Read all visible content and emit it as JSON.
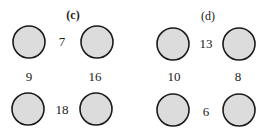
{
  "panels": [
    {
      "label": "(c)",
      "label_pos": [
        73,
        15
      ],
      "bold": true,
      "circles": [
        [
          29,
          42
        ],
        [
          97,
          42
        ],
        [
          28,
          109
        ],
        [
          96,
          109
        ]
      ],
      "numbers": [
        {
          "value": "7",
          "pos": [
            62,
            42
          ]
        },
        {
          "value": "9",
          "pos": [
            29,
            77
          ]
        },
        {
          "value": "16",
          "pos": [
            95,
            77
          ]
        },
        {
          "value": "18",
          "pos": [
            62,
            110
          ]
        }
      ]
    },
    {
      "label": "(d)",
      "label_pos": [
        208,
        16
      ],
      "bold": false,
      "circles": [
        [
          173,
          44
        ],
        [
          239,
          44
        ],
        [
          173,
          110
        ],
        [
          239,
          110
        ]
      ],
      "numbers": [
        {
          "value": "13",
          "pos": [
            206,
            44
          ]
        },
        {
          "value": "10",
          "pos": [
            174,
            77
          ]
        },
        {
          "value": "8",
          "pos": [
            238,
            77
          ]
        },
        {
          "value": "6",
          "pos": [
            206,
            112
          ]
        }
      ]
    }
  ],
  "style": {
    "circle_fill": "#dcdcdc",
    "circle_stroke": "#1a1a1a",
    "radius": 16
  }
}
